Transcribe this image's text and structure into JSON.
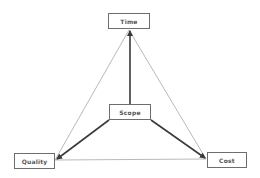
{
  "diagram": {
    "nodes": [
      {
        "id": "time",
        "label": "Time",
        "x": 108,
        "y": 13,
        "w": 42,
        "h": 16
      },
      {
        "id": "scope",
        "label": "Scope",
        "x": 109,
        "y": 104,
        "w": 42,
        "h": 16
      },
      {
        "id": "quality",
        "label": "Quality",
        "x": 14,
        "y": 153,
        "w": 41,
        "h": 16
      },
      {
        "id": "cost",
        "label": "Cost",
        "x": 207,
        "y": 152,
        "w": 40,
        "h": 16
      }
    ],
    "edges": [
      {
        "from": "scope",
        "to": "time",
        "style": "thick-arrow"
      },
      {
        "from": "scope",
        "to": "quality",
        "style": "thick-arrow"
      },
      {
        "from": "scope",
        "to": "cost",
        "style": "thick-arrow"
      },
      {
        "from": "time",
        "to": "quality",
        "style": "thin-line"
      },
      {
        "from": "time",
        "to": "cost",
        "style": "thin-line"
      },
      {
        "from": "quality",
        "to": "cost",
        "style": "thin-line"
      }
    ],
    "colors": {
      "thick": "#3a3a3a",
      "thin": "#8a8a8a",
      "border": "#6e6e6e",
      "text": "#555555"
    }
  }
}
